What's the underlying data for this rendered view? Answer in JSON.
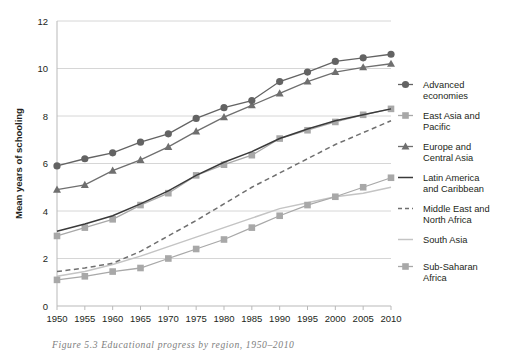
{
  "caption": "Figure 5.3  Educational progress by region, 1950–2010",
  "chart_data": {
    "type": "line",
    "title": "",
    "xlabel": "",
    "ylabel": "Mean years of schooling",
    "x": [
      1950,
      1955,
      1960,
      1965,
      1970,
      1975,
      1980,
      1985,
      1990,
      1995,
      2000,
      2005,
      2010
    ],
    "xtick_labels": [
      "1950",
      "1955",
      "1960",
      "1965",
      "1970",
      "1975",
      "1980",
      "1985",
      "1990",
      "1995",
      "2000",
      "2005",
      "2010"
    ],
    "ytick_labels": [
      "0",
      "2",
      "4",
      "6",
      "8",
      "10",
      "12"
    ],
    "yticks": [
      0,
      2,
      4,
      6,
      8,
      10,
      12
    ],
    "ylim": [
      0,
      12
    ],
    "xlim": [
      1950,
      2010
    ],
    "grid": "horizontal",
    "legend_position": "right",
    "series": [
      {
        "name": "Advanced economies",
        "label_lines": [
          "Advanced",
          "economies"
        ],
        "color": "#636363",
        "marker": "circle",
        "dash": "solid",
        "values": [
          5.9,
          6.2,
          6.45,
          6.9,
          7.25,
          7.9,
          8.35,
          8.65,
          9.45,
          9.85,
          10.3,
          10.45,
          10.6
        ]
      },
      {
        "name": "East Asia and Pacific",
        "label_lines": [
          "East Asia and",
          "Pacific"
        ],
        "color": "#a8a8a8",
        "marker": "square",
        "dash": "solid",
        "values": [
          2.95,
          3.3,
          3.65,
          4.25,
          4.75,
          5.5,
          5.95,
          6.35,
          7.05,
          7.4,
          7.75,
          8.05,
          8.3
        ]
      },
      {
        "name": "Europe and Central Asia",
        "label_lines": [
          "Europe and",
          "Central Asia"
        ],
        "color": "#6f6f6f",
        "marker": "triangle",
        "dash": "solid",
        "values": [
          4.9,
          5.1,
          5.7,
          6.15,
          6.7,
          7.35,
          7.95,
          8.45,
          8.95,
          9.45,
          9.85,
          10.05,
          10.2
        ]
      },
      {
        "name": "Latin America and Caribbean",
        "label_lines": [
          "Latin America",
          "and Caribbean"
        ],
        "color": "#3a3a3a",
        "marker": "none",
        "dash": "solid",
        "values": [
          3.15,
          3.45,
          3.8,
          4.3,
          4.85,
          5.5,
          6.05,
          6.5,
          7.05,
          7.45,
          7.8,
          8.05,
          8.3
        ]
      },
      {
        "name": "Middle East and North Africa",
        "label_lines": [
          "Middle East and",
          "North Africa"
        ],
        "color": "#6f6f6f",
        "marker": "none",
        "dash": "dashed",
        "values": [
          1.45,
          1.6,
          1.8,
          2.3,
          2.95,
          3.6,
          4.3,
          5.0,
          5.6,
          6.2,
          6.8,
          7.3,
          7.8
        ]
      },
      {
        "name": "South Asia",
        "label_lines": [
          "South Asia"
        ],
        "color": "#c4c4c4",
        "marker": "none",
        "dash": "solid",
        "values": [
          1.25,
          1.45,
          1.75,
          2.1,
          2.5,
          2.9,
          3.3,
          3.7,
          4.1,
          4.35,
          4.6,
          4.75,
          5.0
        ]
      },
      {
        "name": "Sub-Saharan Africa",
        "label_lines": [
          "Sub-Saharan",
          "Africa"
        ],
        "color": "#a8a8a8",
        "marker": "square",
        "dash": "solid",
        "values": [
          1.1,
          1.25,
          1.45,
          1.6,
          2.0,
          2.4,
          2.8,
          3.3,
          3.8,
          4.25,
          4.6,
          5.0,
          5.4
        ]
      }
    ]
  }
}
